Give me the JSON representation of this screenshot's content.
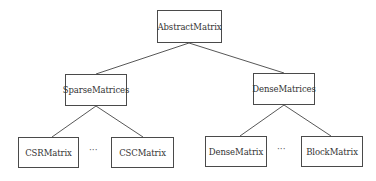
{
  "diagram": {
    "type": "tree",
    "nodes": [
      {
        "id": "abstract",
        "label": "AbstractMatrix",
        "x": 157,
        "y": 10,
        "w": 65,
        "h": 33
      },
      {
        "id": "sparse",
        "label": "SparseMatrices",
        "x": 65,
        "y": 74,
        "w": 62,
        "h": 32
      },
      {
        "id": "dense",
        "label": "DenseMatrices",
        "x": 253,
        "y": 73,
        "w": 62,
        "h": 32
      },
      {
        "id": "csr",
        "label": "CSRMatrix",
        "x": 18,
        "y": 137,
        "w": 61,
        "h": 31
      },
      {
        "id": "csc",
        "label": "CSCMatrix",
        "x": 111,
        "y": 137,
        "w": 63,
        "h": 31
      },
      {
        "id": "densematrix",
        "label": "DenseMatrix",
        "x": 205,
        "y": 136,
        "w": 62,
        "h": 31
      },
      {
        "id": "block",
        "label": "BlockMatrix",
        "x": 301,
        "y": 136,
        "w": 62,
        "h": 31
      }
    ],
    "ellipses": [
      {
        "label": "···",
        "x": 90,
        "y": 148
      },
      {
        "label": "···",
        "x": 278,
        "y": 147
      }
    ],
    "edges": [
      {
        "from": "abstract",
        "to": "sparse"
      },
      {
        "from": "abstract",
        "to": "dense"
      },
      {
        "from": "sparse",
        "to": "csr"
      },
      {
        "from": "sparse",
        "to": "csc"
      },
      {
        "from": "dense",
        "to": "densematrix"
      },
      {
        "from": "dense",
        "to": "block"
      }
    ]
  }
}
